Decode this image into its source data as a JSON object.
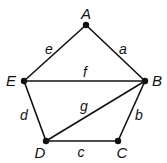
{
  "graph": {
    "vertices": [
      {
        "id": "A",
        "x": 86,
        "y": 25,
        "lx": 86,
        "ly": 19
      },
      {
        "id": "B",
        "x": 145,
        "y": 81,
        "lx": 157,
        "ly": 86
      },
      {
        "id": "C",
        "x": 118,
        "y": 141,
        "lx": 122,
        "ly": 158
      },
      {
        "id": "D",
        "x": 46,
        "y": 141,
        "lx": 40,
        "ly": 158
      },
      {
        "id": "E",
        "x": 24,
        "y": 81,
        "lx": 11,
        "ly": 86
      }
    ],
    "edges": [
      {
        "label": "a",
        "from": "A",
        "to": "B",
        "lx": 123,
        "ly": 54
      },
      {
        "label": "b",
        "from": "B",
        "to": "C",
        "lx": 139,
        "ly": 120
      },
      {
        "label": "c",
        "from": "C",
        "to": "D",
        "lx": 81,
        "ly": 157
      },
      {
        "label": "d",
        "from": "D",
        "to": "E",
        "lx": 24,
        "ly": 120
      },
      {
        "label": "e",
        "from": "E",
        "to": "A",
        "lx": 49,
        "ly": 54
      },
      {
        "label": "f",
        "from": "E",
        "to": "B",
        "lx": 85,
        "ly": 77
      },
      {
        "label": "g",
        "from": "D",
        "to": "B",
        "lx": 84,
        "ly": 111
      }
    ],
    "color": "#111111"
  }
}
